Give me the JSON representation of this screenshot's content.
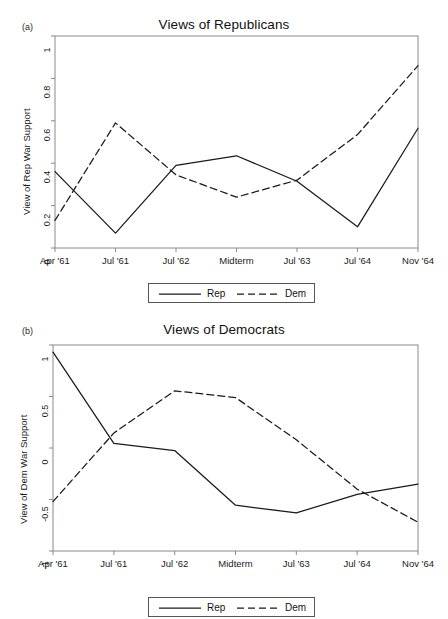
{
  "figure": {
    "background": "#ffffff",
    "line_color": "#1a1a1a",
    "frame_color": "#8a8a8a"
  },
  "panels": [
    {
      "letter": "(a)",
      "title": "Views of Republicans",
      "ylabel": "View of Rep War Support",
      "legend": {
        "rep": "Rep",
        "dem": "Dem"
      },
      "yticks": [
        "0",
        "0.2",
        "0.4",
        "0.6",
        "0.8",
        "1"
      ],
      "xticks": [
        "Apr '61",
        "Jul '61",
        "Jul '62",
        "Midterm",
        "Jul '63",
        "Jul '64",
        "Nov '64"
      ]
    },
    {
      "letter": "(b)",
      "title": "Views of Democrats",
      "ylabel": "View of Dem War Support",
      "legend": {
        "rep": "Rep",
        "dem": "Dem"
      },
      "yticks": [
        "-1",
        "-0.5",
        "0",
        "0.5",
        "1"
      ],
      "xticks": [
        "Apr '61",
        "Jul '61",
        "Jul '62",
        "Midterm",
        "Jul '63",
        "Jul '64",
        "Nov '64"
      ]
    }
  ],
  "chart_data": [
    {
      "type": "line",
      "panel": "(a)",
      "title": "Views of Republicans",
      "xlabel": "",
      "ylabel": "View of Rep War Support",
      "categories": [
        "Apr '61",
        "Jul '61",
        "Jul '62",
        "Midterm",
        "Jul '63",
        "Jul '64",
        "Nov '64"
      ],
      "ylim": [
        0,
        1
      ],
      "yticks": [
        0,
        0.2,
        0.4,
        0.6,
        0.8,
        1
      ],
      "grid": false,
      "legend_position": "below-axes",
      "series": [
        {
          "name": "Rep",
          "style": "solid",
          "values": [
            0.36,
            0.07,
            0.39,
            0.435,
            0.315,
            0.1,
            0.565
          ]
        },
        {
          "name": "Dem",
          "style": "dashed",
          "values": [
            0.13,
            0.59,
            0.345,
            0.24,
            0.32,
            0.535,
            0.86
          ]
        }
      ]
    },
    {
      "type": "line",
      "panel": "(b)",
      "title": "Views of Democrats",
      "xlabel": "",
      "ylabel": "View of Dem War Support",
      "categories": [
        "Apr '61",
        "Jul '61",
        "Jul '62",
        "Midterm",
        "Jul '63",
        "Jul '64",
        "Nov '64"
      ],
      "ylim": [
        -1,
        1
      ],
      "yticks": [
        -1,
        -0.5,
        0,
        0.5,
        1
      ],
      "grid": false,
      "legend_position": "below-axes",
      "series": [
        {
          "name": "Rep",
          "style": "solid",
          "values": [
            0.93,
            0.045,
            -0.025,
            -0.555,
            -0.63,
            -0.45,
            -0.35
          ]
        },
        {
          "name": "Dem",
          "style": "dashed",
          "values": [
            -0.52,
            0.145,
            0.555,
            0.49,
            0.08,
            -0.4,
            -0.72
          ]
        }
      ]
    }
  ]
}
